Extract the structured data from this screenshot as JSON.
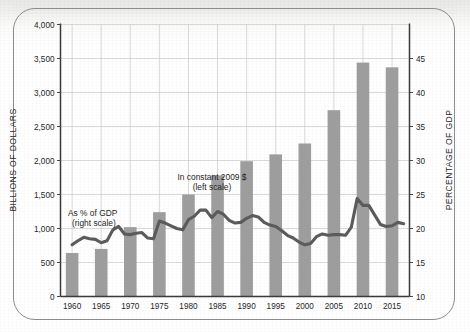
{
  "chart_data": {
    "type": "bar",
    "title": "",
    "subtitle": "",
    "xlabel": "",
    "ylabel": "BILLIONS OF DOLLARS",
    "y2label": "PERCENTAGE OF GDP",
    "grid": true,
    "legend_position": "inside-plot",
    "categories": [
      1960,
      1965,
      1970,
      1975,
      1980,
      1985,
      1990,
      1995,
      2000,
      2005,
      2010,
      2015
    ],
    "xlim": [
      1958,
      2018
    ],
    "ylim": [
      0,
      4000
    ],
    "y2lim": [
      10,
      50
    ],
    "ytick_labels": [
      "4,000",
      "3,500",
      "3,000",
      "2,500",
      "2,000",
      "1,500",
      "1,000",
      "500",
      "0"
    ],
    "ytick_values": [
      4000,
      3500,
      3000,
      2500,
      2000,
      1500,
      1000,
      500,
      0
    ],
    "y2tick_labels": [
      "45",
      "40",
      "35",
      "30",
      "25",
      "20",
      "15",
      "10"
    ],
    "y2tick_values": [
      45,
      40,
      35,
      30,
      25,
      20,
      15,
      10
    ],
    "xtick_labels": [
      "1960",
      "1965",
      "1970",
      "1975",
      "1980",
      "1985",
      "1990",
      "1995",
      "2000",
      "2005",
      "2010",
      "2015"
    ],
    "series": [
      {
        "name": "In constant 2009 $ (left scale)",
        "type": "bar",
        "axis": "left",
        "color": "#9d9d9d",
        "x": [
          1960,
          1965,
          1970,
          1975,
          1980,
          1985,
          1990,
          1995,
          2000,
          2005,
          2010,
          2015
        ],
        "values": [
          640,
          700,
          1020,
          1240,
          1500,
          1780,
          1990,
          2090,
          2250,
          2740,
          3440,
          3370
        ]
      },
      {
        "name": "As % of GDP (right scale)",
        "type": "line",
        "axis": "right",
        "color": "#5b5b5b",
        "x": [
          1960,
          1961,
          1962,
          1963,
          1964,
          1965,
          1966,
          1967,
          1968,
          1969,
          1970,
          1971,
          1972,
          1973,
          1974,
          1975,
          1976,
          1977,
          1978,
          1979,
          1980,
          1981,
          1982,
          1983,
          1984,
          1985,
          1986,
          1987,
          1988,
          1989,
          1990,
          1991,
          1992,
          1993,
          1994,
          1995,
          1996,
          1997,
          1998,
          1999,
          2000,
          2001,
          2002,
          2003,
          2004,
          2005,
          2006,
          2007,
          2008,
          2009,
          2010,
          2011,
          2012,
          2013,
          2014,
          2015,
          2016,
          2017
        ],
        "values": [
          17.6,
          18.2,
          18.7,
          18.5,
          18.4,
          17.9,
          18.2,
          19.8,
          20.3,
          19.2,
          19.1,
          19.3,
          19.4,
          18.6,
          18.5,
          21.1,
          20.8,
          20.4,
          20.0,
          19.8,
          21.3,
          21.8,
          22.7,
          22.7,
          21.6,
          22.5,
          22.1,
          21.2,
          20.8,
          20.9,
          21.5,
          21.9,
          21.7,
          20.9,
          20.5,
          20.3,
          19.7,
          19.0,
          18.6,
          18.0,
          17.6,
          17.8,
          18.8,
          19.2,
          19.0,
          19.1,
          19.1,
          19.0,
          20.2,
          24.4,
          23.4,
          23.4,
          22.0,
          20.6,
          20.3,
          20.4,
          20.9,
          20.7
        ]
      }
    ],
    "annotations": [
      {
        "id": "annot-bars",
        "lines": [
          "In constant 2009 $",
          "(left scale)"
        ]
      },
      {
        "id": "annot-line",
        "lines": [
          "As % of GDP",
          "(right scale)"
        ]
      }
    ],
    "colors": {
      "bar": "#9d9d9d",
      "line": "#5b5b5b",
      "grid": "#c9c9c9",
      "axis": "#3a3a3a",
      "text": "#262626",
      "frame": "#8d8d8d",
      "page": "#fdfdfc"
    }
  }
}
